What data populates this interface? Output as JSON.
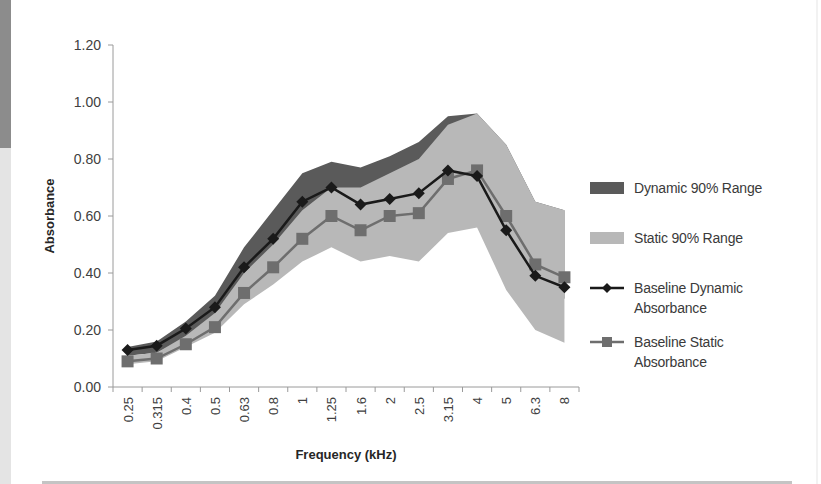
{
  "chart_data": {
    "type": "line",
    "title": "",
    "xlabel": "Frequency (kHz)",
    "ylabel": "Absorbance",
    "ylim": [
      0,
      1.2
    ],
    "yticks": [
      "0.00",
      "0.20",
      "0.40",
      "0.60",
      "0.80",
      "1.00",
      "1.20"
    ],
    "grid": false,
    "legend_position": "right",
    "categories": [
      "0.25",
      "0.315",
      "0.4",
      "0.5",
      "0.63",
      "0.8",
      "1",
      "1.25",
      "1.6",
      "2",
      "2.5",
      "3.15",
      "4",
      "5",
      "6.3",
      "8"
    ],
    "series": [
      {
        "name": "Dynamic 90% Range",
        "kind": "area-band",
        "color": "#5a5a5a",
        "upper": [
          0.14,
          0.16,
          0.23,
          0.32,
          0.49,
          0.62,
          0.75,
          0.79,
          0.77,
          0.81,
          0.86,
          0.95,
          0.96,
          0.85,
          0.65,
          0.62
        ],
        "lower": [
          0.11,
          0.12,
          0.17,
          0.24,
          0.37,
          0.47,
          0.59,
          0.64,
          0.6,
          0.61,
          0.63,
          0.7,
          0.68,
          0.5,
          0.36,
          0.31
        ]
      },
      {
        "name": "Static 90% Range",
        "kind": "area-band",
        "color": "#b8b8b8",
        "upper": [
          0.11,
          0.12,
          0.18,
          0.26,
          0.4,
          0.5,
          0.62,
          0.7,
          0.7,
          0.75,
          0.8,
          0.92,
          0.96,
          0.85,
          0.65,
          0.62
        ],
        "lower": [
          0.08,
          0.09,
          0.14,
          0.19,
          0.29,
          0.36,
          0.44,
          0.49,
          0.44,
          0.46,
          0.44,
          0.54,
          0.56,
          0.34,
          0.2,
          0.155
        ]
      },
      {
        "name": "Baseline Dynamic Absorbance",
        "kind": "line",
        "marker": "diamond",
        "color": "#1a1a1a",
        "values": [
          0.13,
          0.145,
          0.205,
          0.28,
          0.42,
          0.52,
          0.65,
          0.7,
          0.64,
          0.66,
          0.68,
          0.76,
          0.74,
          0.55,
          0.39,
          0.35
        ]
      },
      {
        "name": "Baseline Static Absorbance",
        "kind": "line",
        "marker": "square",
        "color": "#6e6e6e",
        "values": [
          0.09,
          0.1,
          0.15,
          0.21,
          0.33,
          0.42,
          0.52,
          0.6,
          0.55,
          0.6,
          0.61,
          0.73,
          0.76,
          0.6,
          0.43,
          0.385
        ]
      }
    ]
  },
  "legend": {
    "items": [
      {
        "label": "Dynamic 90% Range"
      },
      {
        "label": "Static 90% Range"
      },
      {
        "label_line1": "Baseline Dynamic",
        "label_line2": "Absorbance"
      },
      {
        "label_line1": "Baseline Static",
        "label_line2": "Absorbance"
      }
    ]
  }
}
